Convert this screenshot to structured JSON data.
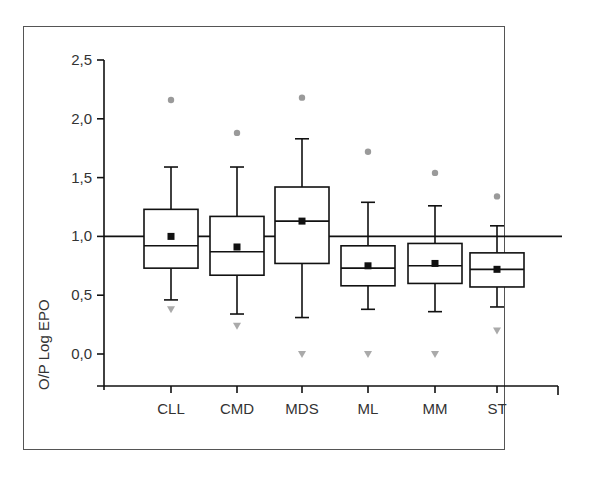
{
  "chart_data": {
    "type": "box",
    "title": "",
    "xlabel": "",
    "ylabel": "O/P Log EPO",
    "ylim": [
      -0.25,
      2.5
    ],
    "yticks": [
      0.0,
      0.5,
      1.0,
      1.5,
      2.0,
      2.5
    ],
    "ytick_labels": [
      "0,0",
      "0,5",
      "1,0",
      "1,5",
      "2,0",
      "2,5"
    ],
    "reference_line": 1.0,
    "grid": false,
    "legend": null,
    "categories": [
      "CLL",
      "CMD",
      "MDS",
      "ML",
      "MM",
      "ST"
    ],
    "series": [
      {
        "name": "CLL",
        "whisker_high": 1.59,
        "q3": 1.23,
        "median": 0.92,
        "q1": 0.73,
        "whisker_low": 0.46,
        "mean": 1.0,
        "max_outlier": 2.16,
        "min_outlier": 0.38
      },
      {
        "name": "CMD",
        "whisker_high": 1.59,
        "q3": 1.17,
        "median": 0.87,
        "q1": 0.67,
        "whisker_low": 0.34,
        "mean": 0.91,
        "max_outlier": 1.88,
        "min_outlier": 0.24
      },
      {
        "name": "MDS",
        "whisker_high": 1.83,
        "q3": 1.42,
        "median": 1.13,
        "q1": 0.77,
        "whisker_low": 0.31,
        "mean": 1.13,
        "max_outlier": 2.18,
        "min_outlier": 0.0
      },
      {
        "name": "ML",
        "whisker_high": 1.29,
        "q3": 0.92,
        "median": 0.73,
        "q1": 0.58,
        "whisker_low": 0.38,
        "mean": 0.75,
        "max_outlier": 1.72,
        "min_outlier": 0.0
      },
      {
        "name": "MM",
        "whisker_high": 1.26,
        "q3": 0.94,
        "median": 0.75,
        "q1": 0.6,
        "whisker_low": 0.36,
        "mean": 0.77,
        "max_outlier": 1.54,
        "min_outlier": 0.0
      },
      {
        "name": "ST",
        "whisker_high": 1.09,
        "q3": 0.86,
        "median": 0.72,
        "q1": 0.57,
        "whisker_low": 0.4,
        "mean": 0.72,
        "max_outlier": 1.34,
        "min_outlier": 0.2
      }
    ],
    "markers": {
      "mean": "filled-square",
      "max_outlier": "grey-circle",
      "min_outlier": "grey-down-triangle"
    },
    "colors": {
      "box": "#111111",
      "mean": "#111111",
      "max_outlier": "#888888",
      "min_outlier": "#aaaaaa",
      "reference_line": "#111111"
    }
  }
}
